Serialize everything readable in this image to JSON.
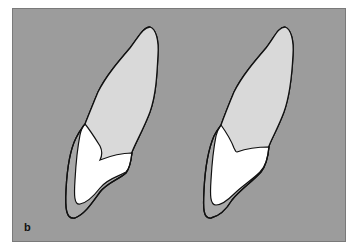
{
  "figure": {
    "panel_label": "b",
    "colors": {
      "background": "#9c9c9c",
      "root": "#d9d9d9",
      "crown": "#ffffff",
      "band": "#a9a9a9",
      "outline": "#111111"
    },
    "items": [
      {
        "name": "left-tooth",
        "description": "Tooth outline with crown restoration and surrounding band"
      },
      {
        "name": "right-tooth",
        "description": "Tooth outline with crown restoration and thinner surrounding band"
      }
    ]
  }
}
